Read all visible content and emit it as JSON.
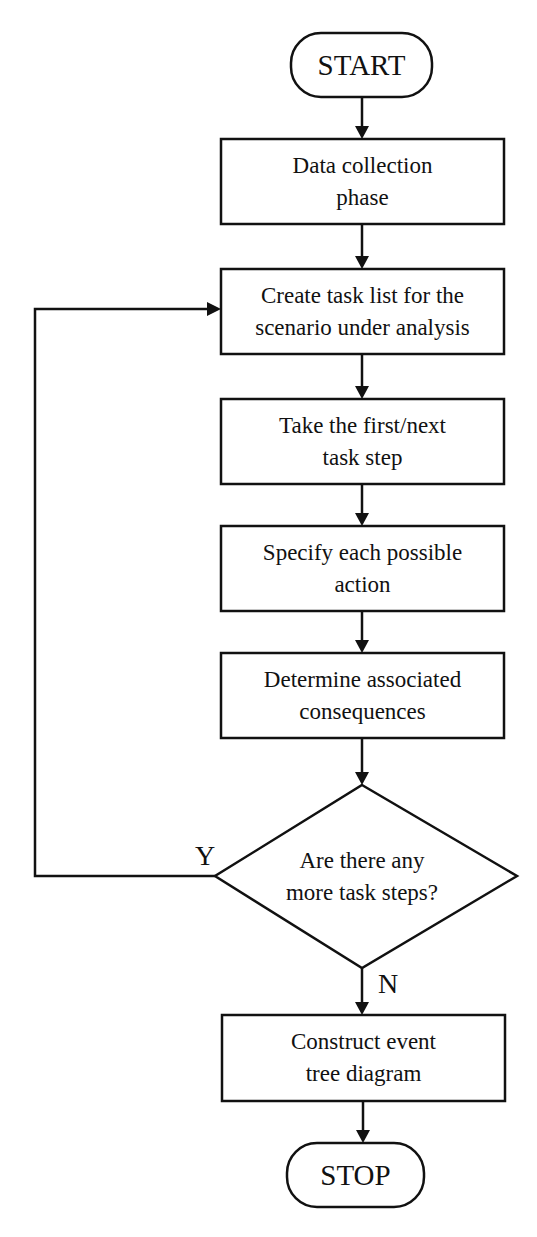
{
  "diagram": {
    "type": "flowchart",
    "start": {
      "label": "START"
    },
    "steps": [
      {
        "id": "data-collection",
        "lines": [
          "Data collection",
          "phase"
        ]
      },
      {
        "id": "create-task-list",
        "lines": [
          "Create task list for the",
          "scenario under analysis"
        ]
      },
      {
        "id": "take-step",
        "lines": [
          "Take the first/next",
          "task step"
        ]
      },
      {
        "id": "specify-action",
        "lines": [
          "Specify each possible",
          "action"
        ]
      },
      {
        "id": "determine-consequences",
        "lines": [
          "Determine associated",
          "consequences"
        ]
      }
    ],
    "decision": {
      "lines": [
        "Are there any",
        "more task steps?"
      ],
      "yes_label": "Y",
      "no_label": "N"
    },
    "final_step": {
      "id": "construct-tree",
      "lines": [
        "Construct event",
        "tree diagram"
      ]
    },
    "stop": {
      "label": "STOP"
    },
    "colors": {
      "stroke": "#111111",
      "background": "#ffffff"
    }
  }
}
